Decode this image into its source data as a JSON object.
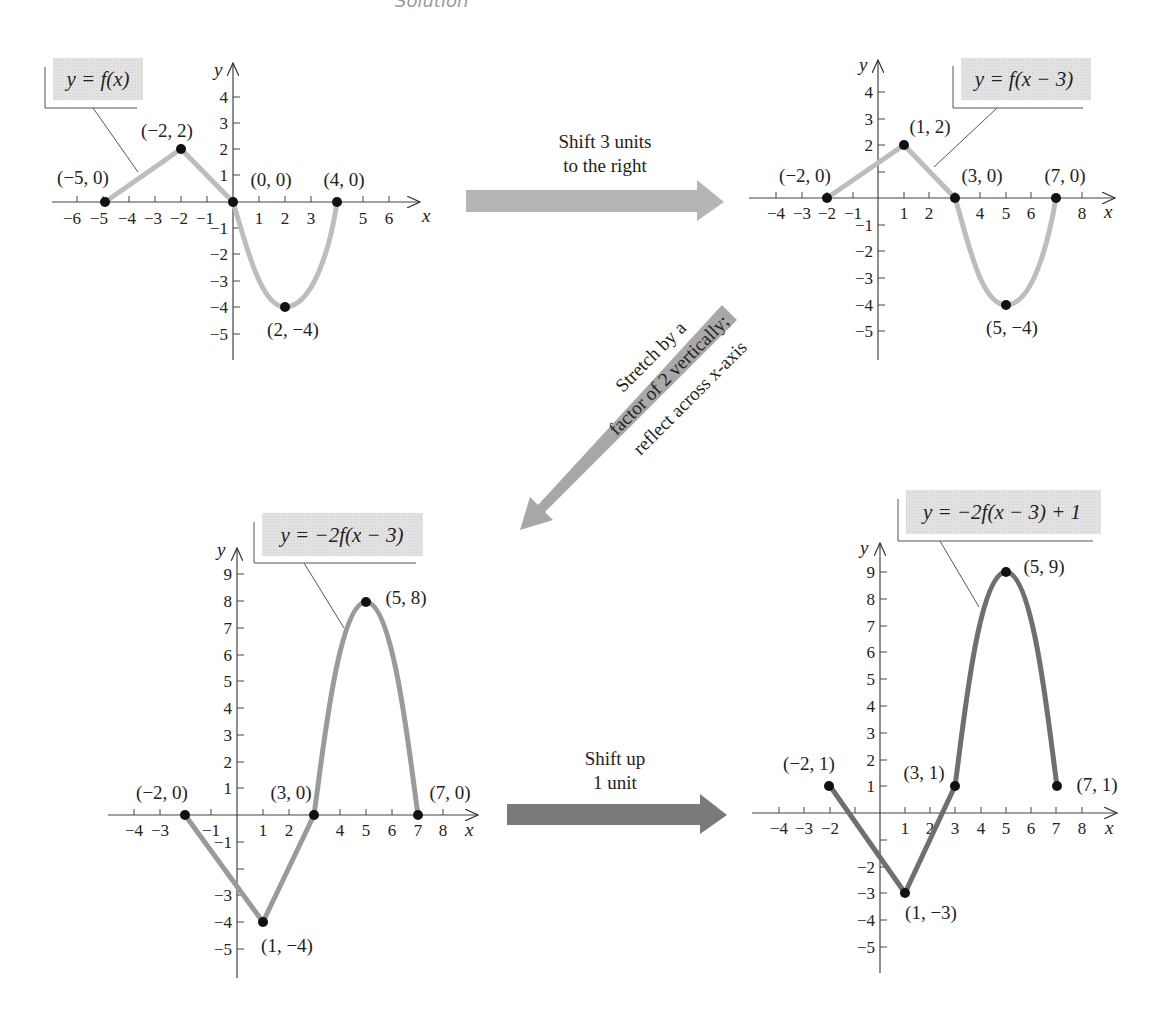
{
  "header": {
    "text": "Solution"
  },
  "arrows": {
    "shift_right": {
      "line1": "Shift 3 units",
      "line2": "to the right",
      "color": "#b5b5b5"
    },
    "stretch_reflect": {
      "line1": "Stretch by a",
      "line2": "factor of 2 vertically;",
      "line3": "reflect across x-axis",
      "color": "#a8a8a8"
    },
    "shift_up": {
      "line1": "Shift up",
      "line2": "1 unit",
      "color": "#7a7a7a"
    }
  },
  "graphs": [
    {
      "id": "g1",
      "label": "y = f(x)",
      "curve_color": "#bdbdbd",
      "points": [
        {
          "label": "(−5, 0)"
        },
        {
          "label": "(−2, 2)"
        },
        {
          "label": "(0, 0)"
        },
        {
          "label": "(2, −4)"
        },
        {
          "label": "(4, 0)"
        }
      ],
      "x_ticks": [
        "−6",
        "−5",
        "−4",
        "−3",
        "−2",
        "−1",
        "1",
        "2",
        "3",
        "5",
        "6"
      ],
      "y_ticks": [
        "4",
        "3",
        "2",
        "1",
        "−1",
        "−2",
        "−3",
        "−4",
        "−5"
      ]
    },
    {
      "id": "g2",
      "label": "y = f(x − 3)",
      "curve_color": "#bdbdbd",
      "points": [
        {
          "label": "(−2, 0)"
        },
        {
          "label": "(1, 2)"
        },
        {
          "label": "(3, 0)"
        },
        {
          "label": "(5, −4)"
        },
        {
          "label": "(7, 0)"
        }
      ],
      "x_ticks": [
        "−4",
        "−3",
        "−2",
        "−1",
        "1",
        "2",
        "4",
        "5",
        "6",
        "8"
      ],
      "y_ticks": [
        "4",
        "3",
        "2",
        "−1",
        "−2",
        "−3",
        "−4",
        "−5"
      ]
    },
    {
      "id": "g3",
      "label": "y = −2f(x − 3)",
      "curve_color": "#9a9a9a",
      "points": [
        {
          "label": "(−2, 0)"
        },
        {
          "label": "(1, −4)"
        },
        {
          "label": "(3, 0)"
        },
        {
          "label": "(5, 8)"
        },
        {
          "label": "(7, 0)"
        }
      ],
      "x_ticks": [
        "−4",
        "−3",
        "−1",
        "1",
        "2",
        "4",
        "5",
        "6",
        "7",
        "8"
      ],
      "y_ticks": [
        "9",
        "8",
        "7",
        "6",
        "5",
        "4",
        "3",
        "2",
        "1",
        "−1",
        "−3",
        "−4",
        "−5"
      ]
    },
    {
      "id": "g4",
      "label": "y = −2f(x − 3) + 1",
      "curve_color": "#6f6f6f",
      "points": [
        {
          "label": "(−2, 1)"
        },
        {
          "label": "(1, −3)"
        },
        {
          "label": "(3, 1)"
        },
        {
          "label": "(5, 9)"
        },
        {
          "label": "(7, 1)"
        }
      ],
      "x_ticks": [
        "−4",
        "−3",
        "−2",
        "1",
        "2",
        "3",
        "4",
        "5",
        "6",
        "7",
        "8"
      ],
      "y_ticks": [
        "9",
        "8",
        "7",
        "6",
        "5",
        "4",
        "3",
        "2",
        "1",
        "−2",
        "−3",
        "−4",
        "−5"
      ]
    }
  ],
  "axis_labels": {
    "x": "x",
    "y": "y"
  }
}
